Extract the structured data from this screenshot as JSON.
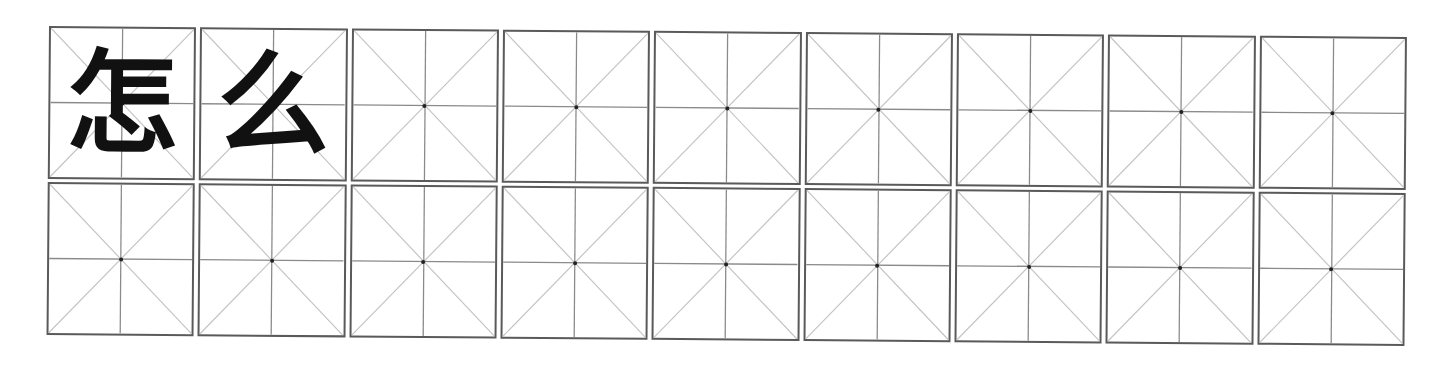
{
  "worksheet": {
    "type": "mi-zi-ge practice grid",
    "rows": 2,
    "columns": 9,
    "colors": {
      "border": "#5a5a5a",
      "center_lines": "#8a8a8a",
      "diagonals": "#c4c4c4",
      "glyph": "#111111"
    },
    "cells": [
      [
        {
          "char": "怎"
        },
        {
          "char": "么"
        },
        {
          "char": ""
        },
        {
          "char": ""
        },
        {
          "char": ""
        },
        {
          "char": ""
        },
        {
          "char": ""
        },
        {
          "char": ""
        },
        {
          "char": ""
        }
      ],
      [
        {
          "char": ""
        },
        {
          "char": ""
        },
        {
          "char": ""
        },
        {
          "char": ""
        },
        {
          "char": ""
        },
        {
          "char": ""
        },
        {
          "char": ""
        },
        {
          "char": ""
        },
        {
          "char": ""
        }
      ]
    ]
  }
}
